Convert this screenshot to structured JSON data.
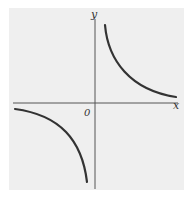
{
  "figure": {
    "background_color": "#efefef",
    "axis_color": "#555555",
    "curve_color": "#333333"
  },
  "labels": {
    "x_axis": "x",
    "y_axis": "y",
    "origin": "0"
  },
  "curves": [
    {
      "name": "upper-right-branch",
      "quadrant": "I",
      "description": "hyperbola branch approaching x-axis and y-axis asymptotically"
    },
    {
      "name": "lower-left-branch",
      "quadrant": "III",
      "description": "hyperbola branch approaching x-axis and y-axis asymptotically"
    }
  ]
}
